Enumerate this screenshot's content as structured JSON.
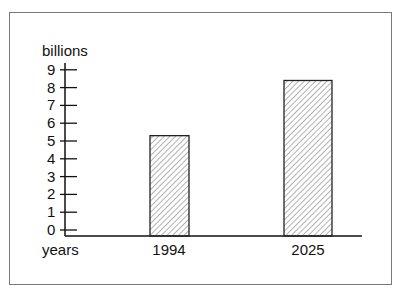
{
  "chart_data": {
    "type": "bar",
    "title": "",
    "ylabel": "billions",
    "xlabel": "years",
    "categories": [
      "1994",
      "2025"
    ],
    "values": [
      5.3,
      8.4
    ],
    "yticks": [
      "0",
      "1",
      "2",
      "3",
      "4",
      "5",
      "6",
      "7",
      "8",
      "9"
    ],
    "ylim": [
      0,
      9
    ],
    "grid": false,
    "legend": null,
    "bar_fill": "diagonal-hatch",
    "colors": {
      "bar_stroke": "#222222",
      "hatch": "#555555",
      "frame": "#7a7a7a"
    }
  }
}
